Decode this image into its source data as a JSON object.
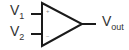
{
  "diagram": {
    "type": "op-amp symbol",
    "inputs": [
      {
        "name": "V",
        "subscript": "1",
        "terminal": "+"
      },
      {
        "name": "V",
        "subscript": "2",
        "terminal": "−"
      }
    ],
    "output": {
      "name": "V",
      "subscript": "out"
    },
    "stroke_color": "#1a1a1a",
    "text_color": "#333333"
  }
}
